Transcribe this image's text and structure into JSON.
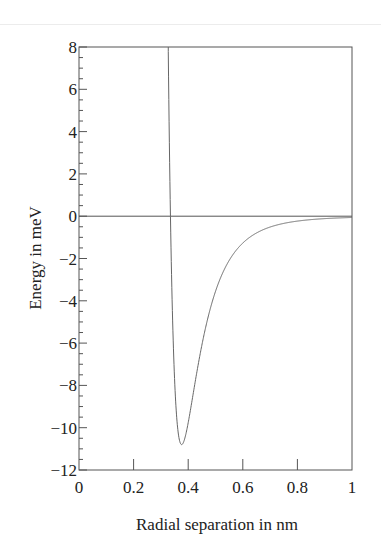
{
  "chart_data": {
    "type": "line",
    "title": "",
    "xlabel": "Radial separation in nm",
    "ylabel": "Energy in meV",
    "xlim": [
      0,
      1
    ],
    "ylim": [
      -12,
      8
    ],
    "xticks": [
      0,
      0.2,
      0.4,
      0.6,
      0.8,
      1
    ],
    "xtick_labels": [
      "0",
      "0.2",
      "0.4",
      "0.6",
      "0.8",
      "1"
    ],
    "yticks": [
      -12,
      -10,
      -8,
      -6,
      -4,
      -2,
      0,
      2,
      4,
      6,
      8
    ],
    "ytick_labels": [
      "−12",
      "−10",
      "−8",
      "−6",
      "−4",
      "−2",
      "0",
      "2",
      "4",
      "6",
      "8"
    ],
    "y_minor_step": 0.5,
    "grid": false,
    "legend": null,
    "zero_line": true,
    "series": [
      {
        "name": "Lennard-Jones potential",
        "model": "lennard-jones",
        "epsilon_meV": 10.8,
        "sigma_nm": 0.335,
        "x": [
          0.326,
          0.335,
          0.34,
          0.35,
          0.36,
          0.376,
          0.39,
          0.4,
          0.42,
          0.45,
          0.5,
          0.55,
          0.6,
          0.65,
          0.7,
          0.8,
          0.9,
          1.0
        ],
        "values": [
          8.0,
          0.0,
          -3.0,
          -7.0,
          -9.5,
          -10.8,
          -10.4,
          -9.8,
          -8.3,
          -6.1,
          -3.6,
          -2.1,
          -1.25,
          -0.78,
          -0.5,
          -0.22,
          -0.11,
          -0.06
        ]
      }
    ],
    "colors": {
      "curve": "#555555",
      "axes": "#555555",
      "text": "#222222"
    }
  }
}
